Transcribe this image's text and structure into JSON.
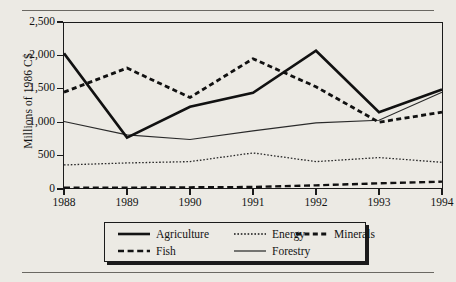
{
  "chart_data": {
    "type": "line",
    "title": "",
    "xlabel": "",
    "ylabel": "Millions of 1986 C$",
    "categories": [
      "1988",
      "1989",
      "1990",
      "1991",
      "1992",
      "1993",
      "1994"
    ],
    "x": [
      1988,
      1989,
      1990,
      1991,
      1992,
      1993,
      1994
    ],
    "ylim": [
      0,
      2500
    ],
    "yticks": [
      0,
      500,
      1000,
      1500,
      2000,
      2500
    ],
    "ytick_labels": [
      "0",
      "500",
      "1,000",
      "1,500",
      "2,000",
      "2,500"
    ],
    "grid": false,
    "legend_position": "bottom",
    "series": [
      {
        "name": "Agriculture",
        "style": "solid-thick",
        "color": "#111111",
        "values": [
          2030,
          770,
          1230,
          1440,
          2070,
          1150,
          1490
        ]
      },
      {
        "name": "Energy",
        "style": "dotted-thin",
        "color": "#2a2a2a",
        "values": [
          360,
          390,
          410,
          540,
          410,
          470,
          400
        ]
      },
      {
        "name": "Minerals",
        "style": "dashed-thick",
        "color": "#111111",
        "values": [
          1450,
          1810,
          1370,
          1950,
          1530,
          1000,
          1150
        ]
      },
      {
        "name": "Fish",
        "style": "dashed-medium",
        "color": "#111111",
        "values": [
          20,
          20,
          25,
          30,
          55,
          85,
          110
        ]
      },
      {
        "name": "Forestry",
        "style": "solid-thin",
        "color": "#2a2a2a",
        "values": [
          1010,
          810,
          740,
          870,
          990,
          1030,
          1450
        ]
      }
    ]
  },
  "legend": {
    "items": [
      {
        "label": "Agriculture",
        "swatch": "solid-thick-swatch"
      },
      {
        "label": "Energy",
        "swatch": "dotted-thin-swatch"
      },
      {
        "label": "Minerals",
        "swatch": "dashed-thick-swatch"
      },
      {
        "label": "Fish",
        "swatch": "dashed-medium-swatch"
      },
      {
        "label": "Forestry",
        "swatch": "solid-thin-swatch"
      }
    ]
  }
}
